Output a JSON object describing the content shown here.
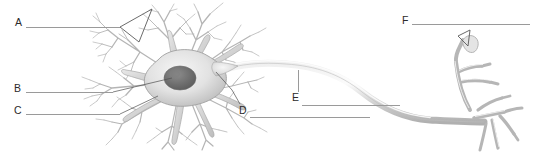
{
  "figure": {
    "background_color": "#ffffff",
    "width": 551,
    "height": 152
  },
  "style": {
    "letter_color": "#2b2b2b",
    "leader_line_color": "#9a9a9a",
    "cell_outline_color": "#9b9b9b",
    "cell_fill_light": "#e6e6e6",
    "cell_fill_mid": "#c9c9c9",
    "nucleus_color": "#6e6e6e",
    "pointer_color": "#5a5a5a"
  },
  "labels": [
    {
      "id": "A",
      "letter": "A",
      "x": 15,
      "y": 17,
      "line": {
        "x": 26,
        "y": 27,
        "length": 94
      }
    },
    {
      "id": "B",
      "letter": "B",
      "x": 14,
      "y": 83,
      "line": {
        "x": 26,
        "y": 92,
        "length": 87
      }
    },
    {
      "id": "C",
      "letter": "C",
      "x": 14,
      "y": 105,
      "line": {
        "x": 26,
        "y": 114,
        "length": 94
      }
    },
    {
      "id": "D",
      "letter": "D",
      "x": 239,
      "y": 105,
      "line": {
        "x": 250,
        "y": 117,
        "length": 120
      }
    },
    {
      "id": "E",
      "letter": "E",
      "x": 292,
      "y": 92,
      "line": {
        "x": 302,
        "y": 105,
        "length": 98
      }
    },
    {
      "id": "F",
      "letter": "F",
      "x": 402,
      "y": 15,
      "line": {
        "x": 412,
        "y": 24,
        "length": 118
      }
    }
  ],
  "leaders": {
    "e_vertical": {
      "x": 298,
      "y_top": 70,
      "height": 22
    }
  },
  "parts": {
    "dendrites": "dendrite-tree",
    "soma": "cell-body",
    "nucleus": "nucleus",
    "axon_hillock": "axon-hillock",
    "axon": "axon",
    "terminals": "axon-terminals"
  }
}
